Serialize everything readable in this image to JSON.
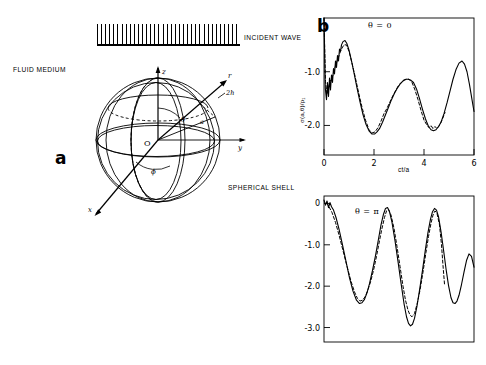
{
  "figure": {
    "panel_a": {
      "letter": "a",
      "labels": {
        "incident_wave": "INCIDENT WAVE",
        "fluid_medium": "FLUID MEDIUM",
        "spherical_shell": "SPHERICAL SHELL"
      },
      "diagram_labels": {
        "axis_z": "z",
        "axis_y": "y",
        "axis_x": "x",
        "radial_vector": "r",
        "origin": "O",
        "theta": "θ",
        "phi": "ϕ",
        "arc_angle": "a",
        "thickness": "2h"
      }
    },
    "panel_b": {
      "letter": "b"
    }
  },
  "chart_data": [
    {
      "type": "line",
      "id": "theta-0",
      "title": "",
      "annotation": "θ = 0",
      "xlabel": "ct/a",
      "ylabel": "σ(a,θ)/p₁",
      "xlim": [
        0,
        6
      ],
      "ylim": [
        0,
        -2.55
      ],
      "xticks": [
        0,
        2,
        4,
        6
      ],
      "xticklabels": [
        "0",
        "2",
        "4",
        "6"
      ],
      "yticks": [
        -1.0,
        -2.0
      ],
      "yticklabels": [
        "-1.0",
        "-2.0"
      ],
      "grid": false,
      "legend": "none",
      "series": [
        {
          "name": "solid",
          "style": "solid",
          "x": [
            0.0,
            0.05,
            0.1,
            0.14,
            0.18,
            0.22,
            0.26,
            0.3,
            0.34,
            0.38,
            0.42,
            0.46,
            0.5,
            0.54,
            0.58,
            0.62,
            0.66,
            0.7,
            0.76,
            0.84,
            0.92,
            1.0,
            1.1,
            1.2,
            1.32,
            1.44,
            1.56,
            1.68,
            1.8,
            1.92,
            2.02,
            2.12,
            2.22,
            2.34,
            2.46,
            2.58,
            2.7,
            2.82,
            2.94,
            3.06,
            3.18,
            3.28,
            3.38,
            3.48,
            3.58,
            3.7,
            3.82,
            3.94,
            4.06,
            4.18,
            4.28,
            4.38,
            4.48,
            4.58,
            4.68,
            4.8,
            4.92,
            5.04,
            5.16,
            5.28,
            5.4,
            5.52,
            5.62,
            5.72,
            5.82,
            5.92,
            6.0
          ],
          "y": [
            0.0,
            -1.3,
            -1.52,
            -1.2,
            -1.46,
            -1.12,
            -1.34,
            -1.06,
            -1.2,
            -0.94,
            -1.04,
            -0.8,
            -0.92,
            -0.7,
            -0.8,
            -0.58,
            -0.62,
            -0.5,
            -0.44,
            -0.42,
            -0.48,
            -0.6,
            -0.8,
            -1.02,
            -1.3,
            -1.56,
            -1.8,
            -1.98,
            -2.1,
            -2.16,
            -2.16,
            -2.12,
            -2.06,
            -1.94,
            -1.8,
            -1.66,
            -1.52,
            -1.4,
            -1.3,
            -1.22,
            -1.16,
            -1.14,
            -1.14,
            -1.16,
            -1.2,
            -1.32,
            -1.5,
            -1.7,
            -1.88,
            -2.02,
            -2.08,
            -2.1,
            -2.08,
            -2.02,
            -1.94,
            -1.78,
            -1.58,
            -1.36,
            -1.14,
            -0.96,
            -0.84,
            -0.8,
            -0.86,
            -1.0,
            -1.24,
            -1.52,
            -1.74
          ]
        },
        {
          "name": "dashed",
          "style": "dashed",
          "x": [
            0.0,
            0.06,
            0.12,
            0.18,
            0.24,
            0.3,
            0.36,
            0.42,
            0.48,
            0.54,
            0.6,
            0.66,
            0.72,
            0.8,
            0.9,
            1.0,
            1.12,
            1.24,
            1.38,
            1.52,
            1.66,
            1.8,
            1.92,
            2.04,
            2.16,
            2.28,
            2.4,
            2.52,
            2.64,
            2.76,
            2.88,
            3.0,
            3.1,
            3.2,
            3.3,
            3.4,
            3.52,
            3.64,
            3.76,
            3.88,
            4.0,
            4.1,
            4.2,
            4.28,
            4.36,
            4.44,
            4.52,
            4.62,
            4.72,
            4.84
          ],
          "y": [
            0.0,
            -1.18,
            -1.42,
            -1.3,
            -1.18,
            -1.14,
            -1.06,
            -0.96,
            -0.86,
            -0.78,
            -0.7,
            -0.62,
            -0.56,
            -0.5,
            -0.5,
            -0.62,
            -0.84,
            -1.08,
            -1.38,
            -1.66,
            -1.9,
            -2.08,
            -2.14,
            -2.12,
            -2.04,
            -1.92,
            -1.78,
            -1.68,
            -1.56,
            -1.44,
            -1.34,
            -1.24,
            -1.2,
            -1.16,
            -1.14,
            -1.14,
            -1.2,
            -1.34,
            -1.52,
            -1.72,
            -1.9,
            -1.98,
            -2.04,
            -2.0,
            -2.06,
            -2.02,
            -2.06,
            -2.0,
            -1.9,
            -1.76
          ]
        }
      ]
    },
    {
      "type": "line",
      "id": "theta-pi",
      "title": "",
      "annotation": "θ = π",
      "xlabel": "",
      "ylabel": "",
      "xlim": [
        0,
        6
      ],
      "ylim": [
        0.18,
        -3.35
      ],
      "xticks": [],
      "xticklabels": [],
      "yticks": [
        0,
        -1.0,
        -2.0,
        -3.0
      ],
      "yticklabels": [
        "0",
        "-1.0",
        "-2.0",
        "-3.0"
      ],
      "grid": false,
      "legend": "none",
      "series": [
        {
          "name": "solid",
          "style": "solid",
          "x": [
            0.0,
            0.06,
            0.12,
            0.18,
            0.24,
            0.3,
            0.38,
            0.48,
            0.6,
            0.74,
            0.88,
            1.02,
            1.16,
            1.3,
            1.42,
            1.52,
            1.62,
            1.72,
            1.82,
            1.94,
            2.06,
            2.18,
            2.28,
            2.38,
            2.46,
            2.54,
            2.62,
            2.72,
            2.84,
            2.96,
            3.08,
            3.2,
            3.3,
            3.38,
            3.46,
            3.54,
            3.62,
            3.72,
            3.82,
            3.94,
            4.06,
            4.16,
            4.26,
            4.34,
            4.42,
            4.5,
            4.58,
            4.68,
            4.78,
            4.88,
            4.98,
            5.08,
            5.16,
            5.24,
            5.32,
            5.4,
            5.5,
            5.6,
            5.7,
            5.8,
            5.9,
            6.0
          ],
          "y": [
            0.08,
            -0.04,
            0.06,
            -0.1,
            0.02,
            -0.08,
            -0.16,
            -0.34,
            -0.62,
            -1.0,
            -1.4,
            -1.8,
            -2.12,
            -2.34,
            -2.42,
            -2.4,
            -2.32,
            -2.16,
            -1.94,
            -1.62,
            -1.26,
            -0.86,
            -0.52,
            -0.26,
            -0.12,
            -0.1,
            -0.2,
            -0.46,
            -0.9,
            -1.4,
            -1.92,
            -2.42,
            -2.74,
            -2.9,
            -2.96,
            -2.92,
            -2.78,
            -2.48,
            -2.1,
            -1.62,
            -1.1,
            -0.7,
            -0.38,
            -0.2,
            -0.12,
            -0.16,
            -0.32,
            -0.68,
            -1.12,
            -1.58,
            -1.98,
            -2.28,
            -2.4,
            -2.42,
            -2.36,
            -2.22,
            -1.96,
            -1.66,
            -1.38,
            -1.22,
            -1.28,
            -1.54
          ]
        },
        {
          "name": "dashed",
          "style": "dashed",
          "x": [
            0.1,
            0.2,
            0.32,
            0.46,
            0.6,
            0.76,
            0.92,
            1.08,
            1.22,
            1.34,
            1.44,
            1.54,
            1.64,
            1.74,
            1.86,
            1.98,
            2.1,
            2.22,
            2.32,
            2.42,
            2.5,
            2.58,
            2.68,
            2.8,
            2.92,
            3.04,
            3.16,
            3.26,
            3.36,
            3.44,
            3.52,
            3.62,
            3.72,
            3.84,
            3.96,
            4.08,
            4.18,
            4.28,
            4.36,
            4.44,
            4.52,
            4.62,
            4.7,
            4.76,
            4.82
          ],
          "y": [
            0.02,
            -0.08,
            -0.22,
            -0.46,
            -0.76,
            -1.14,
            -1.52,
            -1.88,
            -2.14,
            -2.3,
            -2.36,
            -2.34,
            -2.26,
            -2.12,
            -1.9,
            -1.62,
            -1.28,
            -0.9,
            -0.6,
            -0.34,
            -0.18,
            -0.14,
            -0.28,
            -0.6,
            -1.04,
            -1.52,
            -2.0,
            -2.34,
            -2.58,
            -2.7,
            -2.74,
            -2.66,
            -2.44,
            -2.1,
            -1.66,
            -1.18,
            -0.8,
            -0.48,
            -0.28,
            -0.18,
            -0.24,
            -0.52,
            -1.0,
            -1.5,
            -1.95
          ]
        }
      ]
    }
  ]
}
